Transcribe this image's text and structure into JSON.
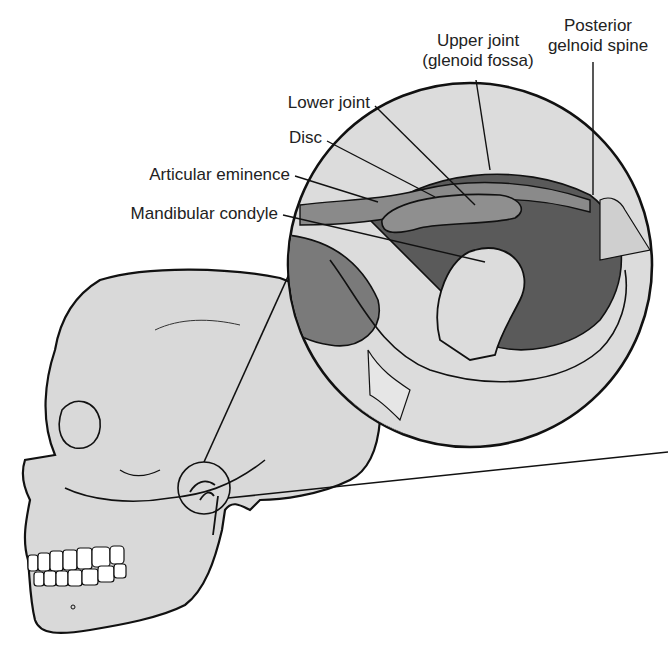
{
  "figure": {
    "colors": {
      "bone": "#d9d9d9",
      "outline": "#111111",
      "dark_tissue": "#6a6a6a",
      "mid_tissue": "#9a9a9a",
      "background": "#ffffff"
    }
  },
  "labels": {
    "upper_joint": {
      "line1": "Upper joint",
      "line2": "(glenoid fossa)"
    },
    "posterior_spine": {
      "line1": "Posterior",
      "line2": "gelnoid spine"
    },
    "lower_joint": "Lower joint",
    "disc": "Disc",
    "articular_eminence": "Articular eminence",
    "mandibular_condyle": "Mandibular condyle"
  }
}
